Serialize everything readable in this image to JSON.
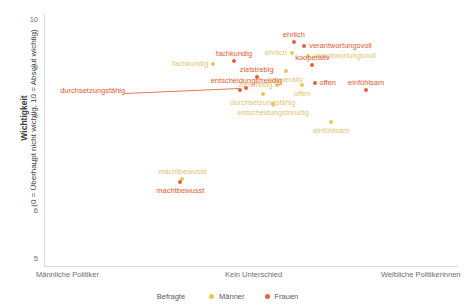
{
  "chart_data": {
    "type": "scatter",
    "title": "",
    "xlabel": "",
    "ylabel": "Wichtigkeit",
    "ylabel_sub": "(0 = Überhaupt nicht wichtig, 10 = Absolut wichtig)",
    "ylabel_bold": "Wichtigkeit",
    "ylim": [
      5,
      10
    ],
    "yticks": [
      "10",
      "9",
      "8",
      "7",
      "6",
      "5"
    ],
    "xticks": [
      "Männliche Politiker",
      "Kein Unterschied",
      "Weibliche Politikerinnen"
    ],
    "xlim": [
      0,
      2
    ],
    "grid": false,
    "legend_position": "bottom",
    "legend_title": "Befragte",
    "series": [
      {
        "name": "Männer",
        "color": "#e8c94f",
        "points": [
          {
            "label": "fachkundig",
            "x": 0.82,
            "y": 9.06,
            "label_pos": "left"
          },
          {
            "label": "zielstrebig",
            "x": 1.13,
            "y": 8.62,
            "label_pos": "left"
          },
          {
            "label": "durchsetzungsfähig",
            "x": 1.06,
            "y": 8.44,
            "label_pos": "below"
          },
          {
            "label": "entscheidungsfreudig",
            "x": 1.11,
            "y": 8.22,
            "label_pos": "below"
          },
          {
            "label": "ehrlich",
            "x": 1.2,
            "y": 9.28,
            "label_pos": "left"
          },
          {
            "label": "verantwortungsvoll",
            "x": 1.28,
            "y": 9.22,
            "label_pos": "right"
          },
          {
            "label": "kooperativ",
            "x": 1.17,
            "y": 8.92,
            "label_pos": "below"
          },
          {
            "label": "offen",
            "x": 1.25,
            "y": 8.62,
            "label_pos": "below"
          },
          {
            "label": "einfühlsam",
            "x": 1.39,
            "y": 7.84,
            "label_pos": "below"
          },
          {
            "label": "machtbewusst",
            "x": 0.67,
            "y": 6.66,
            "label_pos": "above"
          }
        ]
      },
      {
        "name": "Frauen",
        "color": "#e8603c",
        "points": [
          {
            "label": "fachkundig",
            "x": 0.92,
            "y": 9.12,
            "label_pos": "above"
          },
          {
            "label": "zielstrebig",
            "x": 1.03,
            "y": 8.78,
            "label_pos": "above"
          },
          {
            "label": "entscheidungsfreudig",
            "x": 0.98,
            "y": 8.56,
            "label_pos": "above"
          },
          {
            "label": "durchsetzungsfähig",
            "x": 0.95,
            "y": 8.52,
            "label_pos": "leader"
          },
          {
            "label": "ehrlich",
            "x": 1.21,
            "y": 9.52,
            "label_pos": "above"
          },
          {
            "label": "verantwortungsvoll",
            "x": 1.26,
            "y": 9.44,
            "label_pos": "right"
          },
          {
            "label": "kooperativ",
            "x": 1.3,
            "y": 9.04,
            "label_pos": "above"
          },
          {
            "label": "offen",
            "x": 1.31,
            "y": 8.66,
            "label_pos": "right"
          },
          {
            "label": "einfühlsam",
            "x": 1.56,
            "y": 8.52,
            "label_pos": "above"
          },
          {
            "label": "machtbewusst",
            "x": 0.66,
            "y": 6.58,
            "label_pos": "below"
          }
        ]
      }
    ]
  },
  "axes": {
    "y_title_bold": "Wichtigkeit",
    "y_title_sub": "(0 = Überhaupt nicht wichtig, 10 = Absolut wichtig)",
    "y_ticks": [
      "10",
      "9",
      "8",
      "7",
      "6",
      "5"
    ],
    "x_left": "Männliche Politiker",
    "x_center": "Kein Unterschied",
    "x_right": "Weibliche Politikerinnen"
  },
  "legend": {
    "title": "Befragte",
    "items": [
      {
        "label": "Männer",
        "color": "#e8c94f"
      },
      {
        "label": "Frauen",
        "color": "#e8603c"
      }
    ]
  }
}
